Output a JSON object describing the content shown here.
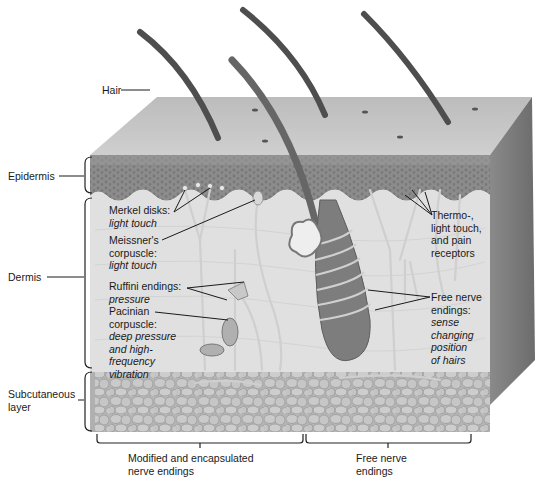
{
  "diagram": {
    "colors": {
      "surface_top": "#c4c4c4",
      "epidermis": "#8f8f8f",
      "dermis": "#e2e2e2",
      "subcutaneous": "#bdbdbd",
      "side_face": "#7a7a7a",
      "hair": "#555555",
      "nerve": "#cfcfcf",
      "leader_line": "#1a1a1a"
    },
    "left_labels": {
      "hair": "Hair",
      "epidermis": "Epidermis",
      "dermis": "Dermis",
      "subcutaneous": [
        "Subcutaneous",
        "layer"
      ]
    },
    "receptors": {
      "merkel": {
        "name": "Merkel disks:",
        "function": "light touch"
      },
      "meissner": {
        "name": [
          "Meissner's",
          "corpuscle:"
        ],
        "function": "light touch"
      },
      "ruffini": {
        "name": "Ruffini endings:",
        "function": "pressure"
      },
      "pacinian": {
        "name": [
          "Pacinian",
          "corpuscle:"
        ],
        "function": [
          "deep pressure",
          "and high-",
          "frequency",
          "vibration"
        ]
      },
      "thermo": {
        "lines": [
          "Thermo-,",
          "light touch,",
          "and pain",
          "receptors"
        ]
      },
      "free_hair": {
        "name": [
          "Free nerve",
          "endings:"
        ],
        "function": [
          "sense",
          "changing",
          "position",
          "of hairs"
        ]
      }
    },
    "bottom_labels": {
      "encapsulated": [
        "Modified and encapsulated",
        "nerve endings"
      ],
      "free": [
        "Free nerve",
        "endings"
      ]
    }
  }
}
